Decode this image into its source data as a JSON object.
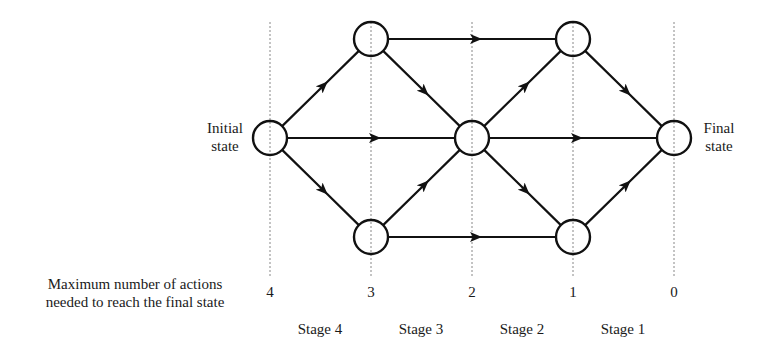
{
  "diagram": {
    "initial_label_line1": "Initial",
    "initial_label_line2": "state",
    "final_label_line1": "Final",
    "final_label_line2": "state",
    "axis_caption_line1": "Maximum number of actions",
    "axis_caption_line2": "needed to reach the final state",
    "counts": [
      "4",
      "3",
      "2",
      "1",
      "0"
    ],
    "stages": [
      "Stage 4",
      "Stage 3",
      "Stage 2",
      "Stage 1"
    ],
    "nodes": [
      {
        "id": "initial",
        "x": 270,
        "y": 138
      },
      {
        "id": "top-a",
        "x": 371,
        "y": 39
      },
      {
        "id": "bottom-a",
        "x": 371,
        "y": 237
      },
      {
        "id": "middle",
        "x": 472,
        "y": 138
      },
      {
        "id": "top-b",
        "x": 573,
        "y": 39
      },
      {
        "id": "bottom-b",
        "x": 573,
        "y": 237
      },
      {
        "id": "final",
        "x": 674,
        "y": 138
      }
    ],
    "edges": [
      [
        "initial",
        "top-a"
      ],
      [
        "initial",
        "middle"
      ],
      [
        "initial",
        "bottom-a"
      ],
      [
        "top-a",
        "top-b"
      ],
      [
        "top-a",
        "middle"
      ],
      [
        "bottom-a",
        "middle"
      ],
      [
        "bottom-a",
        "bottom-b"
      ],
      [
        "middle",
        "top-b"
      ],
      [
        "middle",
        "final"
      ],
      [
        "middle",
        "bottom-b"
      ],
      [
        "top-b",
        "final"
      ],
      [
        "bottom-b",
        "final"
      ]
    ],
    "stroke_color": "#111111",
    "dotted_color": "#888888"
  }
}
